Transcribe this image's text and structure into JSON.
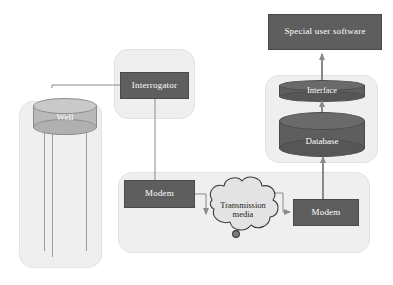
{
  "diagram": {
    "colors": {
      "panel_fill": "#efefef",
      "panel_stroke": "#e2e2e2",
      "box_fill": "#5e5e5e",
      "box_stroke": "#4a4a4a",
      "box_text": "#ffffff",
      "cylinder_light_fill": "#b9b9b9",
      "cylinder_light_top": "#c9c9c9",
      "cylinder_dark_fill": "#5e5e5e",
      "cylinder_dark_top": "#6a6a6a",
      "cloud_fill": "#e3e3e3",
      "cloud_stroke": "#3a3a3a",
      "connector": "#8a8a8a",
      "arrow": "#8a8a8a",
      "background": "#ffffff"
    },
    "nodes": {
      "well": {
        "label": "Well",
        "shape": "cylinder"
      },
      "interrogator": {
        "label": "Interrogator",
        "shape": "rectangle"
      },
      "modem_field": {
        "label": "Modem",
        "shape": "rectangle"
      },
      "transmission_media": {
        "label_line1": "Transmission",
        "label_line2": "media",
        "shape": "cloud"
      },
      "modem_office": {
        "label": "Modem",
        "shape": "rectangle"
      },
      "database": {
        "label": "Database",
        "shape": "cylinder"
      },
      "interface": {
        "label": "Interface",
        "shape": "cylinder"
      },
      "special_user_software": {
        "label": "Special user software",
        "shape": "rectangle"
      }
    },
    "groups": {
      "well_group": {
        "label": ""
      },
      "interrogator_group": {
        "label": ""
      },
      "transmission_group": {
        "label": ""
      },
      "server_group": {
        "label": ""
      }
    },
    "edges": [
      {
        "from": "interrogator",
        "to": "well",
        "arrow": false
      },
      {
        "from": "interrogator",
        "to": "modem_field",
        "arrow": false
      },
      {
        "from": "modem_field",
        "to": "transmission_media",
        "arrow": true
      },
      {
        "from": "transmission_media",
        "to": "modem_office",
        "arrow": true
      },
      {
        "from": "modem_office",
        "to": "database",
        "arrow": true
      },
      {
        "from": "database",
        "to": "interface",
        "arrow": true
      },
      {
        "from": "interface",
        "to": "special_user_software",
        "arrow": true
      }
    ]
  }
}
